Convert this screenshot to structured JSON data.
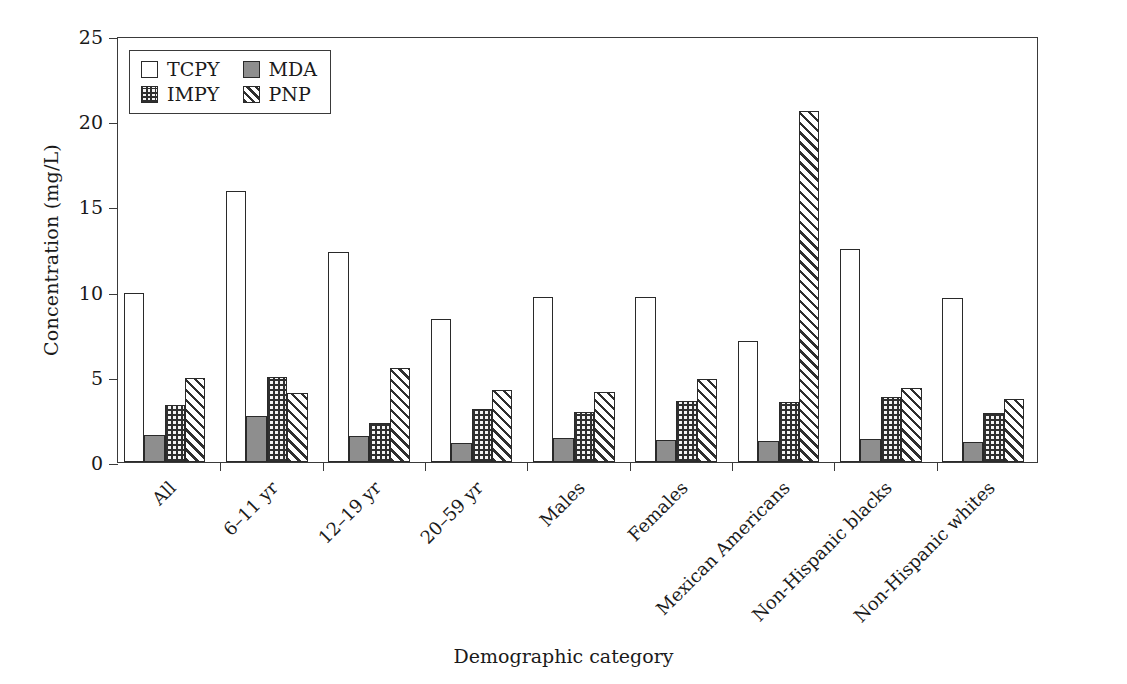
{
  "chart_data": {
    "type": "bar",
    "title": "",
    "xlabel": "Demographic category",
    "ylabel": "Concentration (mg/L)",
    "ylim": [
      0,
      25
    ],
    "yticks": [
      0,
      5,
      10,
      15,
      20,
      25
    ],
    "grid": false,
    "legend_position": "top-left",
    "categories": [
      "All",
      "6–11 yr",
      "12–19 yr",
      "20–59 yr",
      "Males",
      "Females",
      "Mexican Americans",
      "Non-Hispanic blacks",
      "Non-Hispanic whites"
    ],
    "series": [
      {
        "name": "TCPY",
        "fill": "white",
        "values": [
          9.9,
          15.9,
          12.3,
          8.4,
          9.7,
          9.7,
          7.1,
          12.5,
          9.6
        ]
      },
      {
        "name": "MDA",
        "fill": "solid-gray",
        "values": [
          1.6,
          2.7,
          1.5,
          1.1,
          1.4,
          1.3,
          1.25,
          1.35,
          1.2
        ]
      },
      {
        "name": "IMPY",
        "fill": "cross-dot-hatch",
        "values": [
          3.35,
          5.0,
          2.3,
          3.1,
          2.95,
          3.6,
          3.5,
          3.8,
          2.85
        ]
      },
      {
        "name": "PNP",
        "fill": "diagonal-hatch",
        "values": [
          4.95,
          4.05,
          5.5,
          4.25,
          4.1,
          4.85,
          20.6,
          4.35,
          3.7
        ]
      }
    ]
  },
  "legend": {
    "items": [
      {
        "label": "TCPY",
        "swatch": "legend-swatch-tcpy"
      },
      {
        "label": "MDA",
        "swatch": "legend-swatch-mda"
      },
      {
        "label": "IMPY",
        "swatch": "legend-swatch-impy"
      },
      {
        "label": "PNP",
        "swatch": "legend-swatch-pnp"
      }
    ]
  },
  "colors": {
    "axis": "#3a3a3a",
    "bar_outline": "#2a2a2a",
    "mda_fill": "#8e8e8e",
    "hatch": "#2f2f2f",
    "background": "#ffffff"
  }
}
